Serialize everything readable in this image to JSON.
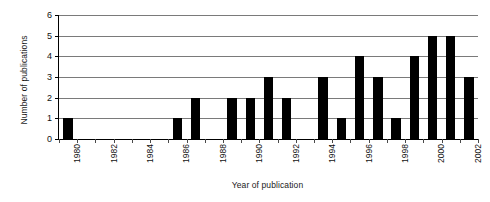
{
  "chart_data": {
    "type": "bar",
    "title": "",
    "xlabel": "Year of publication",
    "ylabel": "Number of publications",
    "categories": [
      "1980",
      "1981",
      "1982",
      "1983",
      "1984",
      "1985",
      "1986",
      "1987",
      "1988",
      "1989",
      "1990",
      "1991",
      "1992",
      "1993",
      "1994",
      "1995",
      "1996",
      "1997",
      "1998",
      "1999",
      "2000",
      "2001",
      "2002"
    ],
    "values": [
      1,
      0,
      0,
      0,
      0,
      0,
      1,
      2,
      0,
      2,
      2,
      3,
      2,
      0,
      3,
      1,
      4,
      3,
      1,
      4,
      5,
      5,
      3
    ],
    "ylim": [
      0,
      6
    ],
    "yticks": [
      0,
      1,
      2,
      3,
      4,
      5,
      6
    ],
    "ytick_labels": [
      "0",
      "1",
      "2",
      "3",
      "4",
      "5",
      "6"
    ],
    "xtick_labels": [
      "1980",
      "1982",
      "1984",
      "1986",
      "1988",
      "1990",
      "1992",
      "1994",
      "1996",
      "1998",
      "2000",
      "2002"
    ],
    "xtick_label_every": 2,
    "grid": "horizontal",
    "legend": "none",
    "bar_color": "#000000",
    "gridline_color": "#7a7a7a",
    "axis_color": "#000000",
    "background_color": "#ffffff"
  }
}
